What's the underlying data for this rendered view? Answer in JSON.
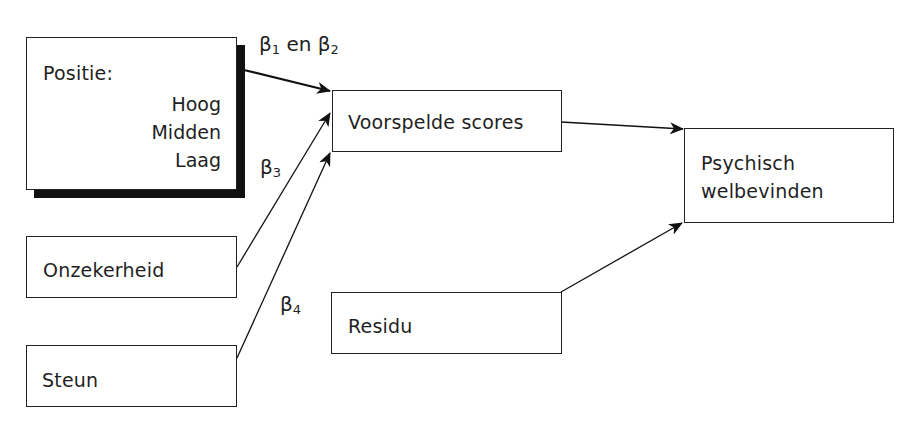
{
  "diagram": {
    "nodes": {
      "positie": {
        "title": "Positie:",
        "levels": [
          "Hoog",
          "Midden",
          "Laag"
        ]
      },
      "onzekerheid": {
        "label": "Onzekerheid"
      },
      "steun": {
        "label": "Steun"
      },
      "voorspelde": {
        "label": "Voorspelde scores"
      },
      "residu": {
        "label": "Residu"
      },
      "psychisch": {
        "line1": "Psychisch",
        "line2": "welbevinden"
      }
    },
    "coefficients": {
      "b12": {
        "symbol1": "β",
        "sub1": "1",
        "conj": " en ",
        "symbol2": "β",
        "sub2": "2"
      },
      "b3": {
        "symbol": "β",
        "sub": "3"
      },
      "b4": {
        "symbol": "β",
        "sub": "4"
      }
    },
    "edges": [
      {
        "from": "Positie",
        "to": "Voorspelde scores",
        "label": "β1 en β2"
      },
      {
        "from": "Onzekerheid",
        "to": "Voorspelde scores",
        "label": "β3"
      },
      {
        "from": "Steun",
        "to": "Voorspelde scores",
        "label": "β4"
      },
      {
        "from": "Voorspelde scores",
        "to": "Psychisch welbevinden",
        "label": ""
      },
      {
        "from": "Residu",
        "to": "Psychisch welbevinden",
        "label": ""
      }
    ],
    "colors": {
      "stroke": "#222222",
      "shadow": "#111111",
      "background": "#ffffff"
    }
  }
}
